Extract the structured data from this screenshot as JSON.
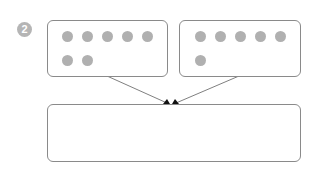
{
  "diagram": {
    "step_badge": "2",
    "colors": {
      "badge": "#b5b5b5",
      "box_border": "#8a8a8a",
      "dot": "#b0b0b0",
      "arrow": "#808080",
      "arrowhead": "#111111"
    },
    "groups": [
      {
        "label": "group-left",
        "dot_count": 7,
        "rows": [
          5,
          2
        ]
      },
      {
        "label": "group-right",
        "dot_count": 6,
        "rows": [
          5,
          1
        ]
      }
    ],
    "result_box": {
      "content": ""
    }
  }
}
